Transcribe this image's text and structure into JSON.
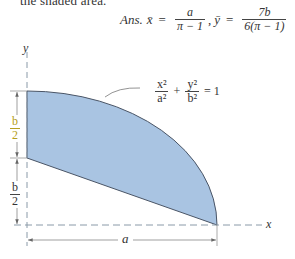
{
  "problem": {
    "text_fragment": "the shaded area.",
    "answer": {
      "prefix": "Ans.",
      "xbar": "x̄",
      "ybar": "ȳ",
      "equals": "=",
      "xbar_num": "a",
      "xbar_den": "π − 1",
      "separator": ",",
      "ybar_num": "7b",
      "ybar_den": "6(π − 1)"
    }
  },
  "figure": {
    "axis_x_label": "x",
    "axis_y_label": "y",
    "equation": {
      "t1_num": "x²",
      "t1_den": "a²",
      "plus": "+",
      "t2_num": "y²",
      "t2_den": "b²",
      "rhs": "= 1"
    },
    "dim_upper": {
      "num": "b",
      "den": "2"
    },
    "dim_lower": {
      "num": "b",
      "den": "2"
    },
    "dim_width": "a",
    "colors": {
      "fill": "#a9c4e2",
      "outline": "#4a5566",
      "axis": "#8a9aa8",
      "dim_upper_accent": "#c9b640"
    }
  }
}
